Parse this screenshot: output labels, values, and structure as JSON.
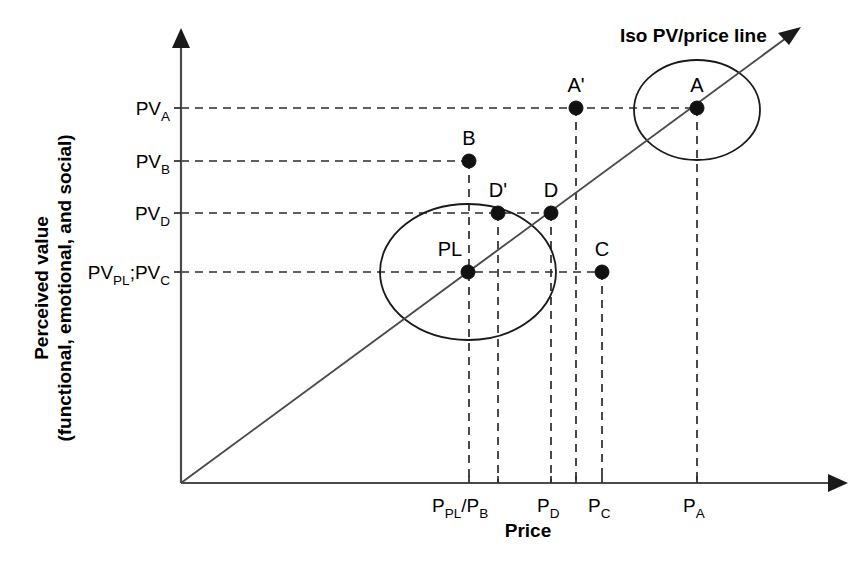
{
  "figure": {
    "type": "scatter-diagram",
    "caption_line": "Iso PV/price line",
    "axes": {
      "x": {
        "title": "Price",
        "tick_labels": [
          {
            "base": "P",
            "sub": "PL",
            "base2": "/P",
            "sub2": "B",
            "x": 469
          },
          {
            "base": "P",
            "sub": "D",
            "x": 551
          },
          {
            "base": "P",
            "sub": "C",
            "x": 602
          },
          {
            "base": "P",
            "sub": "A",
            "x": 697
          }
        ]
      },
      "y": {
        "title_line1": "Perceived value",
        "title_line2": "(functional, emotional, and social)",
        "tick_labels": [
          {
            "base": "PV",
            "sub": "A",
            "y": 108
          },
          {
            "base": "PV",
            "sub": "B",
            "y": 161
          },
          {
            "base": "PV",
            "sub": "D",
            "y": 213
          },
          {
            "base": "PV",
            "sub": "PL",
            "base2": ";PV",
            "sub2": "C",
            "y": 272
          }
        ]
      }
    },
    "points": [
      {
        "label": "A",
        "x": 697,
        "y": 108,
        "label_dx": 0,
        "label_dy": -16
      },
      {
        "label": "A'",
        "x": 576,
        "y": 108,
        "label_dx": 0,
        "label_dy": -16
      },
      {
        "label": "B",
        "x": 469,
        "y": 161,
        "label_dx": 0,
        "label_dy": -16
      },
      {
        "label": "D",
        "x": 551,
        "y": 213,
        "label_dx": 0,
        "label_dy": -16
      },
      {
        "label": "D'",
        "x": 498,
        "y": 213,
        "label_dx": 0,
        "label_dy": -16
      },
      {
        "label": "C",
        "x": 602,
        "y": 272,
        "label_dx": 0,
        "label_dy": -16
      },
      {
        "label": "PL",
        "x": 468,
        "y": 272,
        "label_dx": -6,
        "label_dy": -16
      }
    ],
    "ellipses": [
      {
        "name": "cluster-a",
        "cx": 697,
        "cy": 110,
        "rx": 63,
        "ry": 50
      },
      {
        "name": "cluster-pl",
        "cx": 468,
        "cy": 272,
        "rx": 88,
        "ry": 68
      }
    ],
    "colors": {
      "ink": "#000000",
      "line": "#4a4a4a",
      "dash": "#2b2b2b",
      "background": "#ffffff"
    }
  }
}
